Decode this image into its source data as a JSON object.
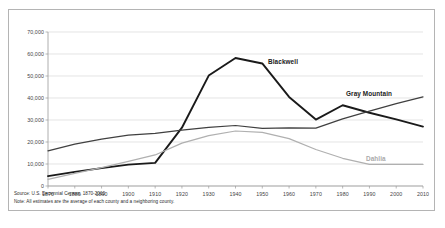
{
  "chart_data": {
    "type": "line",
    "title": "",
    "xlabel": "",
    "ylabel": "",
    "x": [
      1870,
      1880,
      1890,
      1900,
      1910,
      1920,
      1930,
      1940,
      1950,
      1960,
      1970,
      1980,
      1990,
      2000,
      2010
    ],
    "xlim": [
      1870,
      2010
    ],
    "ylim": [
      0,
      70000
    ],
    "yticks": [
      0,
      10000,
      20000,
      30000,
      40000,
      50000,
      60000,
      70000
    ],
    "ytick_labels": [
      "0",
      "10,000",
      "20,000",
      "30,000",
      "40,000",
      "50,000",
      "60,000",
      "70,000"
    ],
    "xtick_labels": [
      "1870",
      "1880",
      "1890",
      "1900",
      "1910",
      "1920",
      "1930",
      "1940",
      "1950",
      "1960",
      "1970",
      "1980",
      "1990",
      "2000",
      "2010"
    ],
    "grid": true,
    "grid_color": "#d9d9d9",
    "legend": "inline-annotations",
    "series": [
      {
        "name": "Blackwell",
        "color": "#1a1a1a",
        "width": 1.9,
        "values": [
          4500,
          6400,
          8100,
          9700,
          10500,
          26500,
          50200,
          58200,
          55700,
          40500,
          30200,
          36700,
          33300,
          30300,
          27000
        ]
      },
      {
        "name": "Gray Mountain",
        "color": "#404040",
        "width": 1.25,
        "values": [
          16000,
          19000,
          21300,
          23100,
          23900,
          25400,
          26600,
          27500,
          26200,
          26400,
          26300,
          30500,
          34000,
          37400,
          40500
        ]
      },
      {
        "name": "Dahlia",
        "color": "#b0b0b0",
        "width": 1.25,
        "values": [
          3000,
          5700,
          8400,
          11200,
          14100,
          19500,
          22900,
          25000,
          24400,
          21500,
          16600,
          12600,
          9800,
          9800,
          9800
        ]
      }
    ],
    "annotations": [
      {
        "text": "Blackwell",
        "series": "Blackwell"
      },
      {
        "text": "Gray Mountain",
        "series": "Gray Mountain"
      },
      {
        "text": "Dahlia",
        "series": "Dahlia"
      }
    ]
  },
  "footnotes": {
    "source": "Source: U.S. Decennial Census, 1870-2010",
    "note": "Note: All estimates are the average of each county and a neighboring county."
  }
}
